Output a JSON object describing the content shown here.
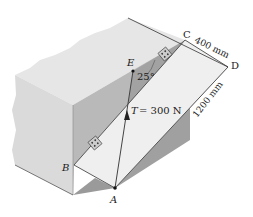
{
  "figure": {
    "points": {
      "A": "A",
      "B": "B",
      "C": "C",
      "D": "D",
      "E": "E"
    },
    "dimensions": {
      "width_cd": "400 mm",
      "length_bd": "1200 mm"
    },
    "angle": "25°",
    "tension": {
      "symbol": "T",
      "value": "= 300 N"
    }
  },
  "colors": {
    "wall_top": "#e6e6e6",
    "wall_front": "#d2d2d2",
    "wall_side": "#b5b5b5",
    "plate": "#efefef",
    "shadow": "#9a9a9a",
    "line": "#333333"
  }
}
